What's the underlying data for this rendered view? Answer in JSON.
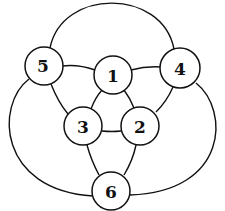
{
  "diagram": {
    "type": "graph",
    "colors": {
      "stroke": "#111111",
      "node_fill": "#ffffff",
      "background": "#ffffff"
    },
    "nodes": [
      {
        "id": "1",
        "label": "1",
        "x": 113,
        "y": 75,
        "r": 19
      },
      {
        "id": "2",
        "label": "2",
        "x": 140,
        "y": 126,
        "r": 19
      },
      {
        "id": "3",
        "label": "3",
        "x": 83,
        "y": 126,
        "r": 19
      },
      {
        "id": "4",
        "label": "4",
        "x": 180,
        "y": 68,
        "r": 20
      },
      {
        "id": "5",
        "label": "5",
        "x": 44,
        "y": 66,
        "r": 19
      },
      {
        "id": "6",
        "label": "6",
        "x": 111,
        "y": 191,
        "r": 19
      }
    ],
    "edges": [
      {
        "from": "5",
        "to": "1"
      },
      {
        "from": "1",
        "to": "4"
      },
      {
        "from": "1",
        "to": "3"
      },
      {
        "from": "1",
        "to": "2"
      },
      {
        "from": "3",
        "to": "2"
      },
      {
        "from": "5",
        "to": "3"
      },
      {
        "from": "4",
        "to": "2"
      },
      {
        "from": "3",
        "to": "6"
      },
      {
        "from": "2",
        "to": "6"
      },
      {
        "from": "5",
        "to": "4",
        "shape": "top-arc"
      },
      {
        "from": "5",
        "to": "6",
        "shape": "left-arc"
      },
      {
        "from": "4",
        "to": "6",
        "shape": "right-arc"
      }
    ]
  }
}
